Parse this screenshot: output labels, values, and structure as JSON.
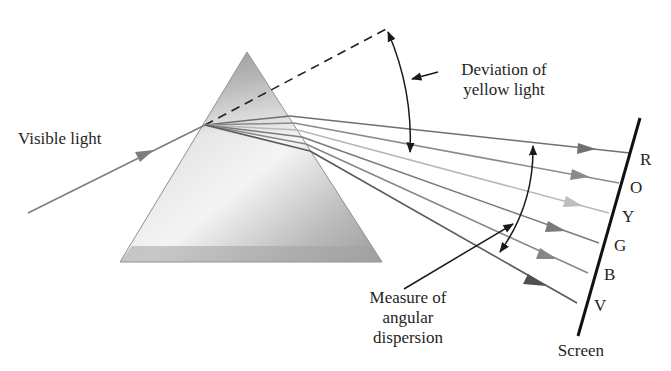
{
  "figure": {
    "labels": {
      "incident": "Visible light",
      "deviation_line1": "Deviation of",
      "deviation_line2": "yellow light",
      "dispersion_line1": "Measure of",
      "dispersion_line2": "angular",
      "dispersion_line3": "dispersion",
      "screen": "Screen"
    },
    "spectrum": [
      {
        "letter": "R",
        "name": "red",
        "color": "#707070"
      },
      {
        "letter": "O",
        "name": "orange",
        "color": "#8a8a8a"
      },
      {
        "letter": "Y",
        "name": "yellow",
        "color": "#b8b8b8"
      },
      {
        "letter": "G",
        "name": "green",
        "color": "#7a7a7a"
      },
      {
        "letter": "B",
        "name": "blue",
        "color": "#868686"
      },
      {
        "letter": "V",
        "name": "violet",
        "color": "#5a5a5a"
      }
    ],
    "colors": {
      "prism_dark": "#9a9a9a",
      "prism_light": "#eeeeee",
      "text": "#1f1f1f",
      "screen": "#111111"
    }
  }
}
